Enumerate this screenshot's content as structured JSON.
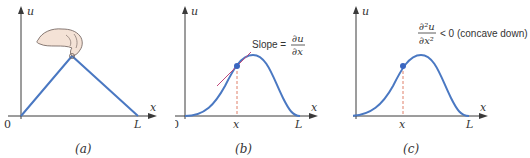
{
  "colors": {
    "curve": "#4a78c2",
    "axis": "#3a3a3a",
    "tangent": "#c04a7a",
    "dashed": "#e0806a",
    "point": "#3a66c0",
    "text": "#333333",
    "hand": "#f2ddd0"
  },
  "panels": [
    {
      "caption": "(a)",
      "y_axis_label": "u",
      "x_axis_label": "x",
      "origin_label": "0",
      "end_label": "L",
      "description": "plucked string triangle",
      "icon": "hand-icon"
    },
    {
      "caption": "(b)",
      "y_axis_label": "u",
      "x_axis_label": "x",
      "origin_label": "0",
      "end_label": "L",
      "point_label": "x",
      "annotation_prefix": "Slope = ",
      "annotation_num": "∂u",
      "annotation_den": "∂x"
    },
    {
      "caption": "(c)",
      "y_axis_label": "u",
      "x_axis_label": "x",
      "origin_label": "0",
      "end_label": "L",
      "point_label": "x",
      "annotation_num": "∂²u",
      "annotation_den": "∂x²",
      "annotation_suffix": "< 0 (concave down)"
    }
  ]
}
